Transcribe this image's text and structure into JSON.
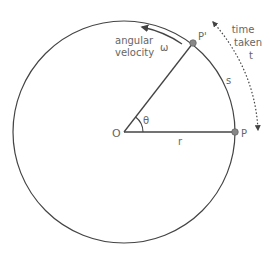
{
  "diagram": {
    "colors": {
      "line": "#444444",
      "text": "#666666",
      "point": "#888888",
      "background": "#ffffff"
    },
    "labels": {
      "center": "O",
      "point_start": "P",
      "point_end": "P'",
      "angle": "θ",
      "radius": "r",
      "arc_length": "s",
      "omega": "ω",
      "angular_velocity_line1": "angular",
      "angular_velocity_line2": "velocity",
      "time_line1": "time",
      "time_line2": "taken",
      "time_line3": "t"
    }
  }
}
